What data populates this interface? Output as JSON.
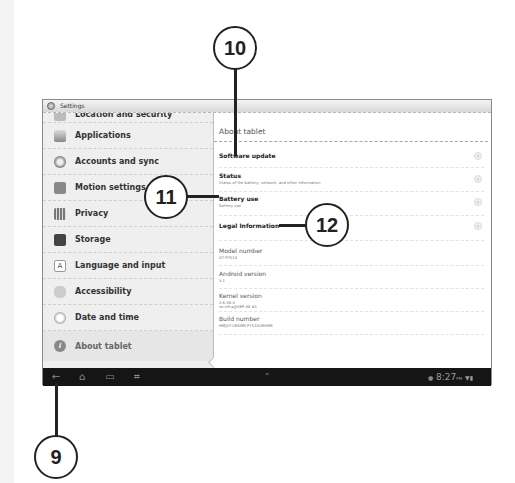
{
  "window": {
    "title": "Settings"
  },
  "sidebar": {
    "partial_item": "Location and security",
    "items": [
      {
        "label": "Applications",
        "icon": "applications-icon"
      },
      {
        "label": "Accounts and sync",
        "icon": "sync-icon"
      },
      {
        "label": "Motion settings",
        "icon": "motion-icon"
      },
      {
        "label": "Privacy",
        "icon": "privacy-icon"
      },
      {
        "label": "Storage",
        "icon": "storage-icon"
      },
      {
        "label": "Language and input",
        "icon": "language-icon"
      },
      {
        "label": "Accessibility",
        "icon": "accessibility-icon"
      },
      {
        "label": "Date and time",
        "icon": "clock-icon"
      },
      {
        "label": "About tablet",
        "icon": "info-icon",
        "active": true
      }
    ]
  },
  "content": {
    "header": "About tablet",
    "rows": [
      {
        "title": "Software update",
        "subtitle": ""
      },
      {
        "title": "Status",
        "subtitle": "Status of the battery, network, and other information"
      },
      {
        "title": "Battery use",
        "subtitle": "Battery use"
      },
      {
        "title": "Legal Information",
        "subtitle": ""
      }
    ],
    "info": [
      {
        "title": "Model number",
        "value": "GT-P7510"
      },
      {
        "title": "Android version",
        "value": "3.1"
      },
      {
        "title": "Kernel version",
        "value": "2.6.36.3",
        "value2": "se.infra@SEP-48 #1"
      },
      {
        "title": "Build number",
        "value": "HMJ37.UEKMB P7510UEKMB"
      }
    ]
  },
  "navbar": {
    "back": "←",
    "home": "⌂",
    "recent": "▭",
    "screenshot": "⌗",
    "up": "⌃",
    "time": "8:27",
    "ampm": "PM"
  },
  "callouts": {
    "c9": "9",
    "c10": "10",
    "c11": "11",
    "c12": "12"
  }
}
